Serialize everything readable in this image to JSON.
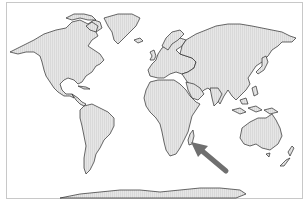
{
  "map": {
    "title": "World map",
    "projection": "Miller-like cylindrical",
    "land_color": "#e3e3e3",
    "outline_color": "#2a2a2a",
    "background_color": "#ffffff",
    "frame_color": "#c8c8c8",
    "highlight": {
      "label": "Madagascar",
      "marker": "arrow-icon",
      "arrow_color": "#6f6f6f"
    },
    "regions": [
      "North America",
      "Greenland",
      "South America",
      "Europe",
      "Africa",
      "Madagascar",
      "Asia",
      "Australia",
      "New Zealand",
      "Antarctica",
      "Japan",
      "Indonesia",
      "United Kingdom",
      "Iceland"
    ]
  }
}
